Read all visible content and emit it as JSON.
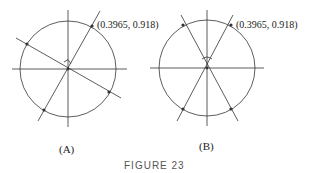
{
  "figure": {
    "caption": "FIGURE 23",
    "panels": [
      {
        "id": "A",
        "label": "(A)",
        "point_label": "(0.3965, 0.918)",
        "angle_marker": "right-angle"
      },
      {
        "id": "B",
        "label": "(B)",
        "point_label": "(0.3965, 0.918)",
        "angle_marker": "arc"
      }
    ],
    "colors": {
      "stroke": "#333333",
      "caption": "#555555"
    }
  }
}
